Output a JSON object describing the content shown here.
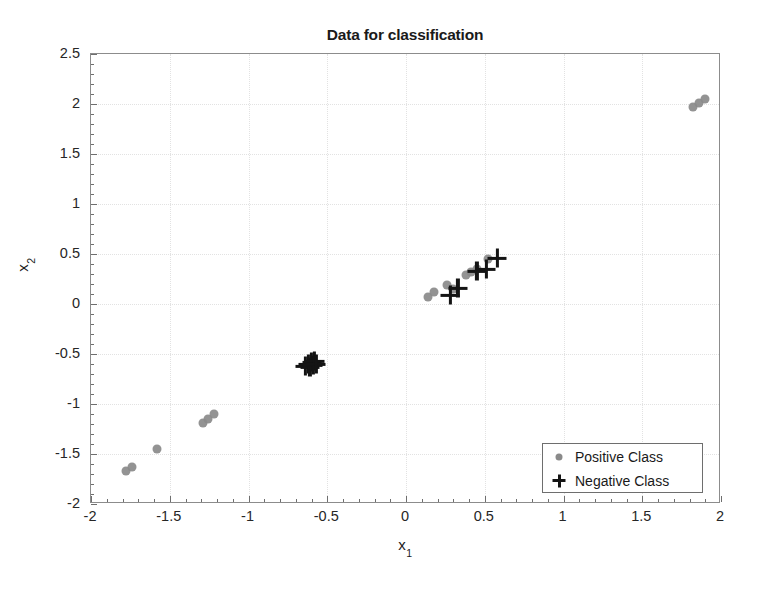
{
  "chart_data": {
    "type": "scatter",
    "title": "Data for classification",
    "xlabel": "x_1",
    "xlabel_base": "x",
    "xlabel_sub": "1",
    "ylabel_base": "x",
    "ylabel_sub": "2",
    "xlim": [
      -2,
      2
    ],
    "ylim": [
      -2,
      2.5
    ],
    "xticks": [
      -2,
      -1.5,
      -1,
      -0.5,
      0,
      0.5,
      1,
      1.5,
      2
    ],
    "xtick_labels": [
      "-2",
      "-1.5",
      "-1",
      "-0.5",
      "0",
      "0.5",
      "1",
      "1.5",
      "2"
    ],
    "yticks": [
      -2,
      -1.5,
      -1,
      -0.5,
      0,
      0.5,
      1,
      1.5,
      2,
      2.5
    ],
    "ytick_labels": [
      "-2",
      "-1.5",
      "-1",
      "-0.5",
      "0",
      "0.5",
      "1",
      "1.5",
      "2",
      "2.5"
    ],
    "grid": true,
    "legend_position": "lower right",
    "series": [
      {
        "name": "Positive Class",
        "marker": "dot",
        "color": "#8a8a8a",
        "points": [
          [
            -1.78,
            -1.67
          ],
          [
            -1.74,
            -1.63
          ],
          [
            -1.58,
            -1.45
          ],
          [
            -1.29,
            -1.19
          ],
          [
            -1.26,
            -1.15
          ],
          [
            -1.22,
            -1.1
          ],
          [
            0.14,
            0.07
          ],
          [
            0.18,
            0.12
          ],
          [
            0.26,
            0.19
          ],
          [
            0.3,
            0.15
          ],
          [
            0.38,
            0.29
          ],
          [
            0.41,
            0.32
          ],
          [
            0.45,
            0.35
          ],
          [
            0.52,
            0.45
          ],
          [
            1.82,
            1.97
          ],
          [
            1.86,
            2.01
          ],
          [
            1.9,
            2.05
          ]
        ]
      },
      {
        "name": "Negative Class",
        "marker": "plus",
        "color": "#141414",
        "points": [
          [
            -0.64,
            -0.62
          ],
          [
            -0.62,
            -0.6
          ],
          [
            -0.61,
            -0.63
          ],
          [
            -0.6,
            -0.58
          ],
          [
            -0.59,
            -0.61
          ],
          [
            -0.58,
            -0.57
          ],
          [
            -0.57,
            -0.6
          ],
          [
            0.28,
            0.09
          ],
          [
            0.33,
            0.16
          ],
          [
            0.45,
            0.33
          ],
          [
            0.51,
            0.35
          ],
          [
            0.58,
            0.46
          ]
        ]
      }
    ]
  },
  "legend": {
    "items": [
      {
        "label": "Positive Class",
        "marker": "dot"
      },
      {
        "label": "Negative Class",
        "marker": "plus"
      }
    ]
  }
}
